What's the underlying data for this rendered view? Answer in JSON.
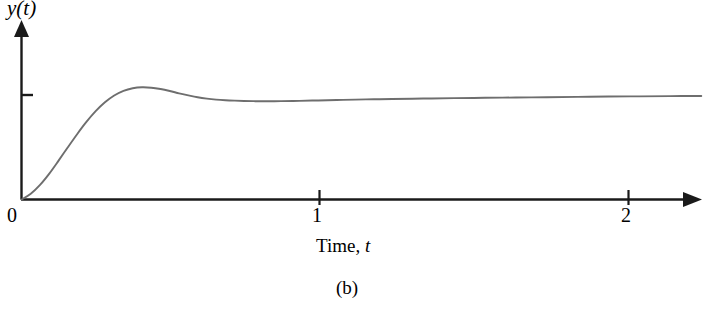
{
  "figure": {
    "caption": "(b)",
    "axis_color": "#1a1a1a",
    "curve_color": "#6e6e6e",
    "background": "#ffffff"
  },
  "chart_data": {
    "type": "line",
    "title": "",
    "subtitle": "",
    "xlabel_prefix": "Time,",
    "xlabel_variable": "t",
    "ylabel": "y(t)",
    "xlim": [
      0,
      2.2
    ],
    "ylim": [
      0,
      1.35
    ],
    "grid": false,
    "legend": null,
    "xticks": [
      0,
      1,
      2
    ],
    "xticklabels": [
      "0",
      "1",
      "2"
    ],
    "yticks": [
      1.0
    ],
    "yticklabels": [
      ""
    ],
    "origin_label": "0",
    "annotations": [],
    "series": [
      {
        "name": "step response",
        "x": [
          0.0,
          0.03,
          0.06,
          0.09,
          0.12,
          0.15,
          0.18,
          0.21,
          0.24,
          0.27,
          0.3,
          0.33,
          0.36,
          0.39,
          0.42,
          0.45,
          0.48,
          0.51,
          0.54,
          0.57,
          0.6,
          0.63,
          0.66,
          0.69,
          0.72,
          0.75,
          0.78,
          0.81,
          0.84,
          0.9,
          0.96,
          1.02,
          1.08,
          1.14,
          1.2,
          1.3,
          1.4,
          1.5,
          1.6,
          1.7,
          1.8,
          1.9,
          2.0,
          2.1,
          2.2
        ],
        "y": [
          0.0,
          0.055,
          0.14,
          0.248,
          0.372,
          0.5,
          0.625,
          0.742,
          0.845,
          0.93,
          0.995,
          1.04,
          1.065,
          1.074,
          1.07,
          1.057,
          1.038,
          1.016,
          0.996,
          0.978,
          0.965,
          0.956,
          0.95,
          0.946,
          0.943,
          0.941,
          0.94,
          0.94,
          0.941,
          0.944,
          0.948,
          0.952,
          0.956,
          0.959,
          0.962,
          0.966,
          0.97,
          0.973,
          0.976,
          0.979,
          0.982,
          0.985,
          0.987,
          0.989,
          0.991
        ],
        "peak_x": 0.39,
        "peak_y": 1.074,
        "steady_state": 1.0
      }
    ]
  }
}
